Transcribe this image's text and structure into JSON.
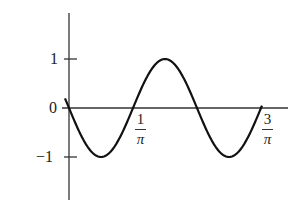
{
  "chart_data": {
    "type": "line",
    "title": "",
    "xlabel": "",
    "ylabel": "",
    "function": "y = -sin(2*pi*x*pi/2)",
    "x_ticks": [
      {
        "position": 0,
        "label": "0",
        "num": "",
        "den": ""
      },
      {
        "position": 0.3183,
        "label": "1/π",
        "num": "1",
        "den": "π"
      },
      {
        "position": 0.9549,
        "label": "3/π",
        "num": "3",
        "den": "π"
      }
    ],
    "y_ticks": [
      {
        "value": 1,
        "label": "1"
      },
      {
        "value": 0,
        "label": "0"
      },
      {
        "value": -1,
        "label": "−1"
      }
    ],
    "ylim": [
      -1.8,
      1.4
    ],
    "series": [
      {
        "name": "wave",
        "x": [
          0,
          0.08,
          0.159,
          0.239,
          0.318,
          0.398,
          0.477,
          0.557,
          0.637,
          0.716,
          0.796,
          0.875,
          0.955
        ],
        "values": [
          0,
          -0.71,
          -1,
          -0.71,
          0,
          0.71,
          1,
          0.71,
          0,
          -0.71,
          -1,
          -0.71,
          0
        ]
      }
    ],
    "grid": false,
    "legend": "none"
  },
  "labels": {
    "y1": "1",
    "y0": "0",
    "ym1": "−1",
    "x1_num": "1",
    "x1_den": "π",
    "x3_num": "3",
    "x3_den": "π"
  }
}
